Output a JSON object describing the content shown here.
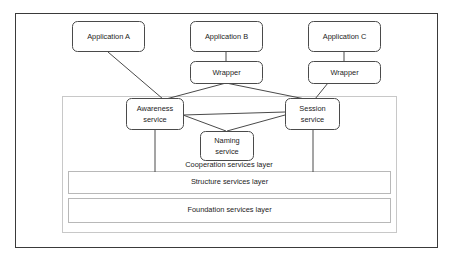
{
  "figure": {
    "background_color": "#ffffff",
    "frame_color": "#3a3a3a",
    "box_stroke_color": "#4a4a4a",
    "panel_stroke_color": "#c8c8c8",
    "layer_stroke_color": "#b8b8b8",
    "text_color": "#1c1c1c"
  },
  "applications": [
    {
      "id": "app-a",
      "label": "Application A"
    },
    {
      "id": "app-b",
      "label": "Application B"
    },
    {
      "id": "app-c",
      "label": "Application C"
    }
  ],
  "wrappers": [
    {
      "id": "wrapper-b",
      "label": "Wrapper"
    },
    {
      "id": "wrapper-c",
      "label": "Wrapper"
    }
  ],
  "services": [
    {
      "id": "awareness-service",
      "line1": "Awareness",
      "line2": "service"
    },
    {
      "id": "session-service",
      "line1": "Session",
      "line2": "service"
    },
    {
      "id": "naming-service",
      "line1": "Naming",
      "line2": "service"
    }
  ],
  "layers": [
    {
      "id": "cooperation-layer",
      "label": "Cooperation services layer"
    },
    {
      "id": "structure-layer",
      "label": "Structure services layer"
    },
    {
      "id": "foundation-layer",
      "label": "Foundation services layer"
    }
  ],
  "connections": [
    {
      "from": "app-a",
      "to": "awareness-service"
    },
    {
      "from": "app-b",
      "to": "wrapper-b"
    },
    {
      "from": "wrapper-b",
      "to": "awareness-service"
    },
    {
      "from": "wrapper-b",
      "to": "session-service"
    },
    {
      "from": "app-c",
      "to": "wrapper-c"
    },
    {
      "from": "wrapper-c",
      "to": "session-service"
    },
    {
      "from": "awareness-service",
      "to": "naming-service"
    },
    {
      "from": "awareness-service",
      "to": "session-service"
    },
    {
      "from": "session-service",
      "to": "naming-service"
    },
    {
      "from": "awareness-service",
      "to": "structure-layer"
    },
    {
      "from": "session-service",
      "to": "structure-layer"
    }
  ]
}
